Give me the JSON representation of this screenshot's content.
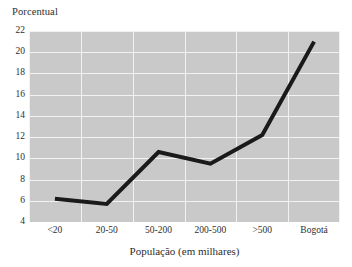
{
  "chart_data": {
    "type": "line",
    "title": "",
    "subtitle": "",
    "xlabel": "População (em milhares)",
    "ylabel": "Porcentual",
    "categories": [
      "<20",
      "20-50",
      "50-200",
      "200-500",
      ">500",
      "Bogotá"
    ],
    "values": [
      6.2,
      5.7,
      10.6,
      9.5,
      12.2,
      21.0
    ],
    "series": [
      {
        "name": "Porcentual",
        "values": [
          6.2,
          5.7,
          10.6,
          9.5,
          12.2,
          21.0
        ]
      }
    ],
    "ylim": [
      4,
      22
    ],
    "yticks": [
      4,
      6,
      8,
      10,
      12,
      14,
      16,
      18,
      20,
      22
    ],
    "ytick_labels": [
      "4",
      "6",
      "8",
      "10",
      "12",
      "14",
      "16",
      "18",
      "20",
      "22"
    ],
    "grid": true,
    "grid_color": "#f2f2f2",
    "plot_background": "#c9c9c9",
    "line_color": "#1a1a1a",
    "line_width": 4,
    "legend": false,
    "legend_position": "none",
    "annotations": []
  },
  "axes": {
    "y_title": "Porcentual",
    "x_title": "População (em milhares)"
  }
}
